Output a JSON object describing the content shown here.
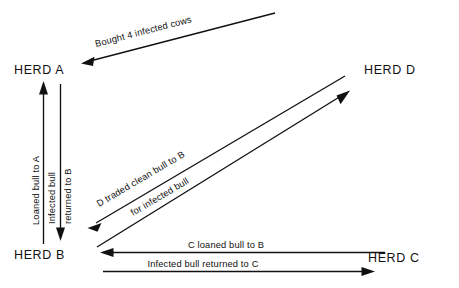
{
  "diagram": {
    "background_color": "#ffffff",
    "line_color": "#111111",
    "nodes": [
      {
        "id": "A",
        "label": "HERD A",
        "x": 14,
        "y": 74
      },
      {
        "id": "D",
        "label": "HERD D",
        "x": 364,
        "y": 74
      },
      {
        "id": "B",
        "label": "HERD B",
        "x": 14,
        "y": 259
      },
      {
        "id": "C",
        "label": "HERD C",
        "x": 368,
        "y": 262
      }
    ],
    "edges": [
      {
        "id": "bought-cows",
        "label": "Bought 4 infected cows",
        "from": "external-source",
        "to": "A",
        "direction": "down-left",
        "arrowheads": "end"
      },
      {
        "id": "loaned-bull-to-a",
        "label": "Loaned bull to A",
        "from": "B",
        "to": "A",
        "direction": "up",
        "arrowheads": "end"
      },
      {
        "id": "infected-bull-returned-to-b",
        "label_line1": "Infected bull",
        "label_line2": "returned to B",
        "from": "A",
        "to": "B",
        "direction": "down",
        "arrowheads": "end"
      },
      {
        "id": "d-traded-clean-bull",
        "label_line1": "D traded clean bull to B",
        "label_line2": "for infected bull",
        "from": "D",
        "to": "B",
        "direction": "down-left",
        "arrowheads": "end"
      },
      {
        "id": "b-infected-bull-to-d",
        "label": "",
        "from": "B",
        "to": "D",
        "direction": "up-right",
        "arrowheads": "end"
      },
      {
        "id": "c-loaned-bull-to-b",
        "label": "C loaned bull to B",
        "from": "C",
        "to": "B",
        "direction": "left",
        "arrowheads": "end"
      },
      {
        "id": "infected-bull-returned-to-c",
        "label": "Infected bull returned to C",
        "from": "B",
        "to": "C",
        "direction": "right",
        "arrowheads": "end"
      }
    ]
  }
}
